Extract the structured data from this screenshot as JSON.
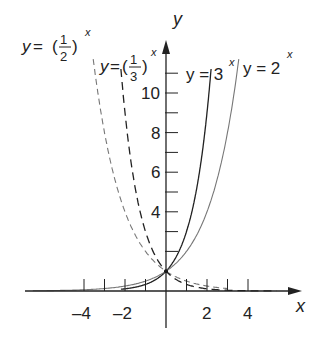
{
  "chart_data": {
    "type": "line",
    "title": "",
    "xlabel": "x",
    "ylabel": "y",
    "xlim": [
      -5.5,
      6
    ],
    "ylim": [
      -1.5,
      12
    ],
    "x_tick_labels": [
      "-4",
      "-2",
      "2",
      "4"
    ],
    "x_ticks": [
      -4,
      -3,
      -2,
      -1,
      1,
      2,
      3,
      4
    ],
    "y_tick_labels": [
      "4",
      "6",
      "8",
      "10"
    ],
    "y_ticks": [
      2,
      3,
      4,
      5,
      6,
      7,
      8,
      9,
      10,
      11
    ],
    "grid": false,
    "series": [
      {
        "name": "y = (1/2)^x",
        "style": "dashed-gray",
        "x": [
          -3.5,
          -3,
          -2,
          -1,
          0,
          1,
          2,
          3
        ],
        "y": [
          11.3,
          8,
          4,
          2,
          1,
          0.5,
          0.25,
          0.125
        ]
      },
      {
        "name": "y = (1/3)^x",
        "style": "dashed-black",
        "x": [
          -2.2,
          -2,
          -1,
          0,
          1,
          2,
          3,
          4,
          5
        ],
        "y": [
          11.2,
          9,
          3,
          1,
          0.33,
          0.11,
          0.04,
          0.01,
          0.004
        ]
      },
      {
        "name": "y = 3^x",
        "style": "solid-black",
        "x": [
          -2,
          -1,
          0,
          1,
          2,
          2.2
        ],
        "y": [
          0.11,
          0.33,
          1,
          3,
          9,
          11.2
        ]
      },
      {
        "name": "y = 2^x",
        "style": "solid-gray",
        "x": [
          -5.5,
          -4,
          -2,
          0,
          1,
          2,
          3,
          3.5
        ],
        "y": [
          0.02,
          0.06,
          0.25,
          1,
          2,
          4,
          8,
          11.3
        ]
      }
    ]
  },
  "labels": {
    "y_axis": "y",
    "x_axis": "x",
    "half": {
      "prefix": "y = (",
      "num": "1",
      "den": "2",
      "suffix": ")",
      "exp": "x"
    },
    "third": {
      "prefix": "y=(",
      "num": "1",
      "den": "3",
      "suffix": ")",
      "exp": "x"
    },
    "three": {
      "text": "y = 3",
      "exp": "x"
    },
    "two": {
      "text": "y = 2",
      "exp": "x"
    }
  }
}
